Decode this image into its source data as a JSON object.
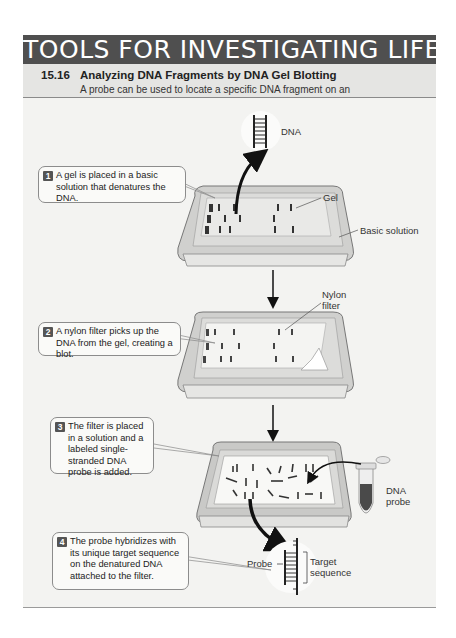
{
  "banner": {
    "title": "TOOLS FOR INVESTIGATING LIFE"
  },
  "figure": {
    "number": "15.16",
    "title": "Analyzing DNA Fragments by DNA Gel Blotting",
    "description": "A probe can be used to locate a specific DNA fragment on an electrophoresis gel."
  },
  "steps": [
    {
      "number": "1",
      "text": "A gel is placed in a basic solution that denatures the DNA."
    },
    {
      "number": "2",
      "text": "A nylon filter picks up the DNA from the gel, creating a blot."
    },
    {
      "number": "3",
      "text": "The filter is placed in a solution and a labeled single-stranded DNA probe is added."
    },
    {
      "number": "4",
      "text": "The probe hybridizes with its unique target sequence on the denatured DNA attached to the filter."
    }
  ],
  "labels": {
    "dna": "DNA",
    "gel": "Gel",
    "basic_solution": "Basic solution",
    "nylon_filter_line1": "Nylon",
    "nylon_filter_line2": "filter",
    "dna_probe_line1": "DNA",
    "dna_probe_line2": "probe",
    "probe": "Probe",
    "target_line1": "Target",
    "target_line2": "sequence"
  },
  "colors": {
    "banner_bg": "#4f4f4f",
    "subhead_bg": "#e5e5e3",
    "diagram_bg": "#f3f3f1",
    "tray": "#c8c8c6",
    "band": "#3a3a3a"
  }
}
